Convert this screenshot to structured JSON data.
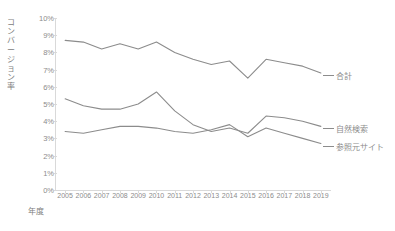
{
  "chart_data": {
    "type": "line",
    "title": "",
    "xlabel": "年度",
    "ylabel": "コンバージョン率",
    "categories": [
      "2005",
      "2006",
      "2007",
      "2008",
      "2009",
      "2010",
      "2011",
      "2012",
      "2013",
      "2014",
      "2015",
      "2016",
      "2017",
      "2018",
      "2019"
    ],
    "ylim": [
      0,
      10
    ],
    "ytick_labels": [
      "10%",
      "9%",
      "8%",
      "7%",
      "6%",
      "5%",
      "4%",
      "3%",
      "2%",
      "1%",
      "0%"
    ],
    "ytick_values": [
      10,
      9,
      8,
      7,
      6,
      5,
      4,
      3,
      2,
      1,
      0
    ],
    "grid": false,
    "legend_position": "right-inline",
    "series": [
      {
        "name": "合計",
        "color": "#8c8c8c",
        "values": [
          8.7,
          8.6,
          8.2,
          8.5,
          8.2,
          8.6,
          8.0,
          7.6,
          7.3,
          7.5,
          6.5,
          7.6,
          7.4,
          7.2,
          6.8
        ]
      },
      {
        "name": "自然検索",
        "color": "#8c8c8c",
        "values": [
          5.3,
          4.9,
          4.7,
          4.7,
          5.0,
          5.7,
          4.6,
          3.8,
          3.4,
          3.6,
          3.3,
          4.3,
          4.2,
          4.0,
          3.7
        ]
      },
      {
        "name": "参照元サイト",
        "color": "#8c8c8c",
        "values": [
          3.4,
          3.3,
          3.5,
          3.7,
          3.7,
          3.6,
          3.4,
          3.3,
          3.5,
          3.8,
          3.1,
          3.6,
          3.3,
          3.0,
          2.7
        ]
      }
    ]
  },
  "axis": {
    "y_label": "コンバージョン率",
    "x_label": "年度"
  },
  "legend": {
    "items": [
      {
        "label": "合計"
      },
      {
        "label": "自然検索"
      },
      {
        "label": "参照元サイト"
      }
    ]
  },
  "header": {
    "cut_off_text": ""
  }
}
